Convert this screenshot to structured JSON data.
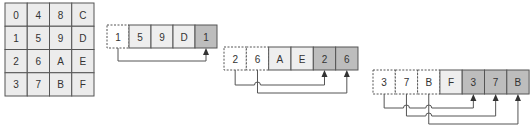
{
  "colors": {
    "grid_fill": "#ececec",
    "grid_stroke": "#555555",
    "original_fill": "#ffffff",
    "plain_fill": "#eeeeee",
    "copy_fill": "#bdbdbd",
    "stroke": "#555555",
    "arrow": "#333333"
  },
  "grid": {
    "x": 5,
    "y": 3,
    "cell_w": 22.25,
    "cell_h": 23.25,
    "rows": [
      [
        "0",
        "4",
        "8",
        "C"
      ],
      [
        "1",
        "5",
        "9",
        "D"
      ],
      [
        "2",
        "6",
        "A",
        "E"
      ],
      [
        "3",
        "7",
        "B",
        "F"
      ]
    ]
  },
  "strips": [
    {
      "x": 107,
      "y": 25,
      "cell_w": 22,
      "cell_h": 23,
      "cells": [
        {
          "label": "1",
          "kind": "original"
        },
        {
          "label": "5",
          "kind": "plain"
        },
        {
          "label": "9",
          "kind": "plain"
        },
        {
          "label": "D",
          "kind": "plain"
        },
        {
          "label": "1",
          "kind": "copy"
        }
      ],
      "arrows": [
        {
          "from": 0,
          "to": 4,
          "y": 61
        }
      ]
    },
    {
      "x": 224,
      "y": 47,
      "cell_w": 22.33,
      "cell_h": 23,
      "cells": [
        {
          "label": "2",
          "kind": "original"
        },
        {
          "label": "6",
          "kind": "original"
        },
        {
          "label": "A",
          "kind": "plain"
        },
        {
          "label": "E",
          "kind": "plain"
        },
        {
          "label": "2",
          "kind": "copy"
        },
        {
          "label": "6",
          "kind": "copy"
        }
      ],
      "arrows": [
        {
          "from": 0,
          "to": 4,
          "y": 85
        },
        {
          "from": 1,
          "to": 5,
          "y": 93
        }
      ]
    },
    {
      "x": 373,
      "y": 70,
      "cell_w": 22.3,
      "cell_h": 24,
      "cells": [
        {
          "label": "3",
          "kind": "original"
        },
        {
          "label": "7",
          "kind": "original"
        },
        {
          "label": "B",
          "kind": "original"
        },
        {
          "label": "F",
          "kind": "plain"
        },
        {
          "label": "3",
          "kind": "copy"
        },
        {
          "label": "7",
          "kind": "copy"
        },
        {
          "label": "B",
          "kind": "copy"
        }
      ],
      "arrows": [
        {
          "from": 0,
          "to": 4,
          "y": 108
        },
        {
          "from": 1,
          "to": 5,
          "y": 116
        },
        {
          "from": 2,
          "to": 6,
          "y": 124
        }
      ]
    }
  ]
}
